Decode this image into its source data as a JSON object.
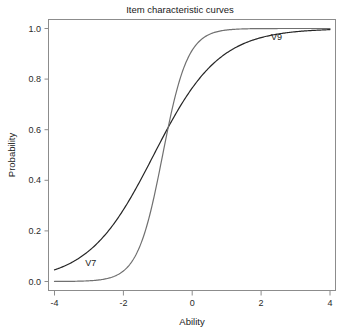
{
  "chart_data": {
    "type": "line",
    "title": "Item characteristic curves",
    "xlabel": "Ability",
    "ylabel": "Probability",
    "xlim": [
      -4,
      4
    ],
    "ylim": [
      0.0,
      1.0
    ],
    "xticks": [
      "-4",
      "-2",
      "0",
      "2",
      "4"
    ],
    "xtick_values": [
      -4,
      -2,
      0,
      2,
      4
    ],
    "yticks": [
      "0.0",
      "0.2",
      "0.4",
      "0.6",
      "0.8",
      "1.0"
    ],
    "ytick_values": [
      0.0,
      0.2,
      0.4,
      0.6,
      0.8,
      1.0
    ],
    "grid": false,
    "legend_position": "inline-annotations",
    "series": [
      {
        "name": "V7",
        "color": "#262626",
        "linewidth": 1.2,
        "label_x": -2.95,
        "label_y": 0.062,
        "model": "2PL logistic",
        "discrimination": 0.62,
        "difficulty": -1.12,
        "x": [
          -4.0,
          -3.6,
          -3.2,
          -2.8,
          -2.4,
          -2.0,
          -1.6,
          -1.2,
          -0.8,
          -0.4,
          0.0,
          0.4,
          0.8,
          1.2,
          1.6,
          2.0,
          2.4,
          2.8,
          3.2,
          3.6,
          4.0
        ],
        "values": [
          0.052,
          0.068,
          0.088,
          0.113,
          0.145,
          0.184,
          0.232,
          0.288,
          0.352,
          0.421,
          0.493,
          0.565,
          0.634,
          0.698,
          0.755,
          0.804,
          0.845,
          0.878,
          0.905,
          0.927,
          0.944
        ]
      },
      {
        "name": "V9",
        "color": "#707070",
        "linewidth": 1.2,
        "label_x": 2.45,
        "label_y": 0.955,
        "model": "2PL logistic",
        "discrimination": 1.62,
        "difficulty": -0.86,
        "x": [
          -4.0,
          -3.6,
          -3.2,
          -2.8,
          -2.4,
          -2.0,
          -1.6,
          -1.2,
          -0.8,
          -0.4,
          0.0,
          0.4,
          0.8,
          1.2,
          1.6,
          2.0,
          2.4,
          2.8,
          3.2,
          3.6,
          4.0
        ],
        "values": [
          0.007,
          0.013,
          0.024,
          0.045,
          0.082,
          0.144,
          0.24,
          0.372,
          0.524,
          0.672,
          0.791,
          0.876,
          0.929,
          0.96,
          0.978,
          0.988,
          0.993,
          0.996,
          0.998,
          0.999,
          0.999
        ]
      }
    ]
  },
  "figure": {
    "background": "#ffffff",
    "frame_color": "#8c8c8c",
    "text_color": "#1a1a1a"
  }
}
